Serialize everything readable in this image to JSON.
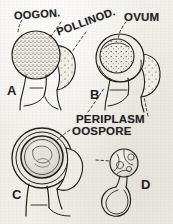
{
  "figure": {
    "background_color": "#f3f1ec",
    "ink_color": "#1d1d1b",
    "stipple_color": "#3a3833"
  },
  "labels": {
    "oogonium": "OOGON.",
    "pollinodium": "POLLINOD.",
    "ovum": "OVUM",
    "periplasm": "PERIPLASM",
    "oospore": "OOSPORE",
    "zoospores": "ZOOSPORES"
  },
  "panels": [
    {
      "letter": "A",
      "caption": "OOGON."
    },
    {
      "letter": "B",
      "caption": "OVUM"
    },
    {
      "letter": "C",
      "caption": "OOSPORE"
    },
    {
      "letter": "D",
      "caption": "ZOOSPORES"
    }
  ],
  "icons": {
    "leader_line": "dashed-leader-line-icon",
    "oogonium_sphere": "oogonium-sphere-icon",
    "pollinodium_crescent": "pollinodium-crescent-icon",
    "oospore_rings": "oospore-concentric-rings-icon",
    "zoospore_sac": "zoospore-sac-icon"
  }
}
